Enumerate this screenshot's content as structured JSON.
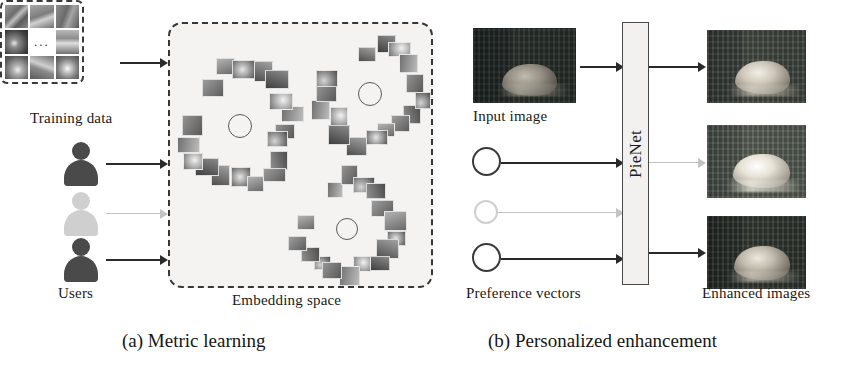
{
  "figure": {
    "panels": [
      {
        "id": "a",
        "caption": "(a) Metric learning",
        "labels": {
          "training_data": "Training data",
          "users": "Users",
          "embedding_space": "Embedding space",
          "ellipsis": "..."
        },
        "training_grid": {
          "rows": 3,
          "cols": 3,
          "center_cell": "ellipsis",
          "cell_tones": [
            "#7d7d7d",
            "#8a8a8a",
            "#828282",
            "#5a5a5a",
            "",
            "#8d8d8d",
            "#9a9a9a",
            "#6f6f6f",
            "#7a7a7a"
          ]
        },
        "users": [
          {
            "name": "user-1",
            "tone": "#4a4a4a",
            "arrow": "solid"
          },
          {
            "name": "user-2",
            "tone": "#cfcfcf",
            "arrow": "faded"
          },
          {
            "name": "user-3",
            "tone": "#4a4a4a",
            "arrow": "solid"
          }
        ],
        "clusters": [
          {
            "name": "cluster-left",
            "cx": 238,
            "cy": 124,
            "r": 52,
            "count": 18,
            "center_ring": 12
          },
          {
            "name": "cluster-top-right",
            "cx": 368,
            "cy": 92,
            "r": 50,
            "count": 16,
            "center_ring": 12
          },
          {
            "name": "cluster-bottom-right",
            "cx": 345,
            "cy": 227,
            "r": 48,
            "count": 16,
            "center_ring": 11
          }
        ]
      },
      {
        "id": "b",
        "caption": "(b) Personalized enhancement",
        "labels": {
          "input_image": "Input image",
          "preference_vectors": "Preference vectors",
          "enhanced_images": "Enhanced images",
          "network": "PieNet"
        },
        "preference_vectors": [
          {
            "name": "pref-vector-1",
            "tone": "#3a3a3a",
            "radius": 15,
            "arrow": "solid"
          },
          {
            "name": "pref-vector-2",
            "tone": "#c9c9c9",
            "radius": 12,
            "arrow": "faded"
          },
          {
            "name": "pref-vector-3",
            "tone": "#3a3a3a",
            "radius": 15,
            "arrow": "solid"
          }
        ],
        "enhanced_images": [
          {
            "name": "enhanced-image-1",
            "brightness": "medium"
          },
          {
            "name": "enhanced-image-2",
            "brightness": "bright"
          },
          {
            "name": "enhanced-image-3",
            "brightness": "dark"
          }
        ]
      }
    ],
    "colors": {
      "ink": "#1a1a1a",
      "arrow": "#2a2a2a",
      "arrow_faded": "#c3c3c3",
      "embedding_fill": "#f4f3f1",
      "dashed_border": "#373737",
      "network_fill": "#f2f1ef"
    }
  }
}
